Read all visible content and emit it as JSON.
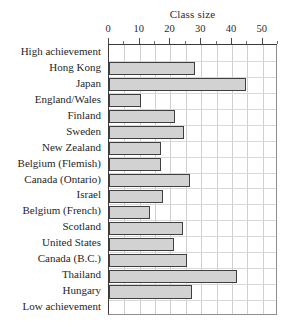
{
  "chart_data": {
    "type": "bar",
    "orientation": "horizontal",
    "title": "Class size",
    "xlabel": "Class size",
    "ylabel": "",
    "xlim": [
      0,
      55
    ],
    "xticks": [
      0,
      10,
      20,
      30,
      40,
      50
    ],
    "xtick_labels": [
      "0",
      "10",
      "20",
      "30",
      "40",
      "50"
    ],
    "minor_tick_step": 5,
    "grid": true,
    "legend": "none",
    "bar_fill_color": "#d2d2d2",
    "bar_edge_color": "#3f3f3f",
    "categories": [
      "High achievement",
      "Hong Kong",
      "Japan",
      "England/Wales",
      "Finland",
      "Sweden",
      "New Zealand",
      "Belgium (Flemish)",
      "Canada (Ontario)",
      "Israel",
      "Belgium (French)",
      "Scotland",
      "United States",
      "Canada (B.C.)",
      "Thailand",
      "Hungary",
      "Low achievement"
    ],
    "values": [
      null,
      28,
      44.5,
      10.5,
      21.5,
      24.5,
      17,
      17,
      26.5,
      17.5,
      13.5,
      24,
      21,
      25.5,
      41.5,
      27,
      null
    ]
  }
}
